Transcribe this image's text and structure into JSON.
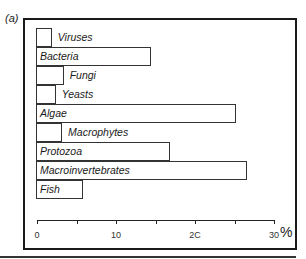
{
  "panel_label": "(a)",
  "chart_data": {
    "type": "bar",
    "orientation": "horizontal",
    "title": "",
    "xlabel": "%",
    "ylabel": "",
    "categories": [
      "Viruses",
      "Bacteria",
      "Fungi",
      "Yeasts",
      "Algae",
      "Macrophytes",
      "Protozoa",
      "Macroinvertebrates",
      "Fish"
    ],
    "values": [
      2,
      14.5,
      3.5,
      2.5,
      25.3,
      3.3,
      17,
      26.7,
      6
    ],
    "xlim": [
      0,
      30
    ],
    "xticks": [
      0,
      10,
      20,
      30
    ],
    "xtick_labels": [
      "0",
      "10",
      "2C",
      "30"
    ],
    "minor_ticks": [
      5,
      15,
      25
    ],
    "grid": false,
    "legend": null
  },
  "axis": {
    "unit_label": "%"
  }
}
